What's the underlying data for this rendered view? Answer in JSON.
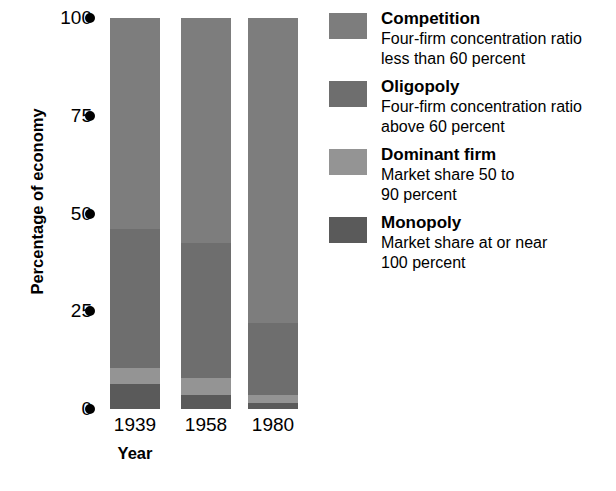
{
  "chart_data": {
    "type": "bar",
    "subtype": "stacked-bar",
    "title": "",
    "xlabel": "Year",
    "ylabel": "Percentage of economy",
    "categories": [
      "1939",
      "1958",
      "1980"
    ],
    "ylim": [
      0,
      100
    ],
    "yticks": [
      0,
      25,
      50,
      75,
      100
    ],
    "ytick_labels": [
      "0",
      "25",
      "50",
      "75",
      "100"
    ],
    "grid": false,
    "legend_position": "right",
    "stack_order_bottom_to_top": [
      "Monopoly",
      "Dominant firm",
      "Oligopoly",
      "Competition"
    ],
    "series": [
      {
        "name": "Competition",
        "color": "#7d7d7d",
        "values": [
          54.0,
          57.5,
          78.0
        ]
      },
      {
        "name": "Oligopoly",
        "color": "#6e6e6e",
        "values": [
          35.5,
          34.5,
          18.5
        ]
      },
      {
        "name": "Dominant firm",
        "color": "#949494",
        "values": [
          4.0,
          4.5,
          2.0
        ]
      },
      {
        "name": "Monopoly",
        "color": "#5a5a5a",
        "values": [
          6.5,
          3.5,
          1.5
        ]
      }
    ]
  },
  "axis": {
    "y_title": "Percentage of economy",
    "x_title": "Year",
    "ticks": [
      {
        "label": "100",
        "value": 100
      },
      {
        "label": "75",
        "value": 75
      },
      {
        "label": "50",
        "value": 50
      },
      {
        "label": "25",
        "value": 25
      },
      {
        "label": "0",
        "value": 0
      }
    ]
  },
  "bars": [
    {
      "label": "1939"
    },
    {
      "label": "1958"
    },
    {
      "label": "1980"
    }
  ],
  "legend": {
    "entries": [
      {
        "title": "Competition",
        "desc_line1": "Four-firm concentration ratio",
        "desc_line2": "less than 60 percent",
        "color": "#7d7d7d"
      },
      {
        "title": "Oligopoly",
        "desc_line1": "Four-firm concentration ratio",
        "desc_line2": "above 60 percent",
        "color": "#6e6e6e"
      },
      {
        "title": "Dominant firm",
        "desc_line1": "Market share 50 to",
        "desc_line2": "90 percent",
        "color": "#949494"
      },
      {
        "title": "Monopoly",
        "desc_line1": "Market share at or near",
        "desc_line2": "100 percent",
        "color": "#5a5a5a"
      }
    ]
  },
  "geometry": {
    "plot_top_px": 18,
    "plot_bottom_px": 409,
    "bar_width_px": 50,
    "bar_left_px": [
      110,
      181,
      248
    ],
    "tick_label_right_px": 92,
    "tick_dot_left_px": 85
  }
}
